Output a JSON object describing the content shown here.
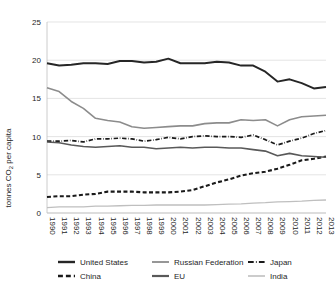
{
  "chart_data": {
    "type": "line",
    "title": "",
    "xlabel": "",
    "ylabel": "tonnes CO2 per capita",
    "ylabel_rich": "tonnes CO₂ per capita",
    "xlim": [
      1990,
      2013
    ],
    "ylim": [
      0,
      25
    ],
    "yticks": [
      0,
      5,
      10,
      15,
      20,
      25
    ],
    "ytick_labels": [
      "0",
      "5",
      "10",
      "15",
      "20",
      "25"
    ],
    "grid": true,
    "legend_position": "bottom",
    "x": [
      1990,
      1991,
      1992,
      1993,
      1994,
      1995,
      1996,
      1997,
      1998,
      1999,
      2000,
      2001,
      2002,
      2003,
      2004,
      2005,
      2006,
      2007,
      2008,
      2009,
      2010,
      2011,
      2012,
      2013
    ],
    "categories": [
      "1990",
      "1991",
      "1992",
      "1993",
      "1994",
      "1995",
      "1996",
      "1997",
      "1998",
      "1999",
      "2000",
      "2001",
      "2002",
      "2003",
      "2004",
      "2005",
      "2006",
      "2007",
      "2008",
      "2009",
      "2010",
      "2011",
      "2012",
      "2013"
    ],
    "series": [
      {
        "name": "United States",
        "color": "#262626",
        "style": "solid",
        "width": 1.9,
        "values": [
          19.6,
          19.3,
          19.4,
          19.6,
          19.6,
          19.5,
          19.9,
          19.9,
          19.7,
          19.8,
          20.2,
          19.6,
          19.6,
          19.6,
          19.8,
          19.7,
          19.3,
          19.3,
          18.5,
          17.2,
          17.5,
          17.0,
          16.3,
          16.5
        ]
      },
      {
        "name": "Russian Federation",
        "color": "#8c8c8c",
        "style": "solid",
        "width": 1.6,
        "values": [
          16.4,
          15.9,
          14.6,
          13.7,
          12.4,
          12.1,
          11.9,
          11.3,
          11.1,
          11.2,
          11.3,
          11.4,
          11.4,
          11.7,
          11.8,
          11.8,
          12.2,
          12.1,
          12.2,
          11.4,
          12.2,
          12.6,
          12.7,
          12.8
        ]
      },
      {
        "name": "Japan",
        "color": "#1a1a1a",
        "style": "dashdot",
        "width": 1.7,
        "values": [
          9.4,
          9.4,
          9.5,
          9.3,
          9.7,
          9.7,
          9.8,
          9.7,
          9.4,
          9.6,
          9.9,
          9.7,
          10.0,
          10.1,
          10.0,
          10.0,
          9.9,
          10.2,
          9.6,
          8.9,
          9.4,
          9.8,
          10.4,
          10.8
        ]
      },
      {
        "name": "China",
        "color": "#1a1a1a",
        "style": "dashed",
        "width": 2.1,
        "values": [
          2.1,
          2.2,
          2.2,
          2.4,
          2.5,
          2.8,
          2.8,
          2.8,
          2.7,
          2.7,
          2.7,
          2.8,
          3.0,
          3.5,
          4.0,
          4.4,
          4.9,
          5.2,
          5.4,
          5.8,
          6.3,
          6.9,
          7.1,
          7.4
        ]
      },
      {
        "name": "EU",
        "color": "#595959",
        "style": "solid",
        "width": 1.6,
        "values": [
          9.3,
          9.2,
          8.9,
          8.7,
          8.6,
          8.7,
          8.8,
          8.6,
          8.6,
          8.4,
          8.5,
          8.6,
          8.5,
          8.6,
          8.6,
          8.5,
          8.5,
          8.3,
          8.1,
          7.5,
          7.8,
          7.5,
          7.4,
          7.3
        ]
      },
      {
        "name": "India",
        "color": "#bfbfbf",
        "style": "solid",
        "width": 1.3,
        "values": [
          0.7,
          0.8,
          0.8,
          0.8,
          0.9,
          0.9,
          0.95,
          1.0,
          1.0,
          1.05,
          1.05,
          1.05,
          1.05,
          1.05,
          1.1,
          1.15,
          1.2,
          1.3,
          1.35,
          1.45,
          1.5,
          1.55,
          1.65,
          1.7
        ]
      }
    ]
  },
  "legend": {
    "items": [
      {
        "label": "United States",
        "color": "#262626",
        "style": "solid",
        "width": 2.4
      },
      {
        "label": "Russian Federation",
        "color": "#8c8c8c",
        "style": "solid",
        "width": 1.8
      },
      {
        "label": "Japan",
        "color": "#1a1a1a",
        "style": "dashdot",
        "width": 2.2
      },
      {
        "label": "China",
        "color": "#1a1a1a",
        "style": "dashed",
        "width": 2.6
      },
      {
        "label": "EU",
        "color": "#595959",
        "style": "solid",
        "width": 2.2
      },
      {
        "label": "India",
        "color": "#bfbfbf",
        "style": "solid",
        "width": 1.6
      }
    ]
  }
}
